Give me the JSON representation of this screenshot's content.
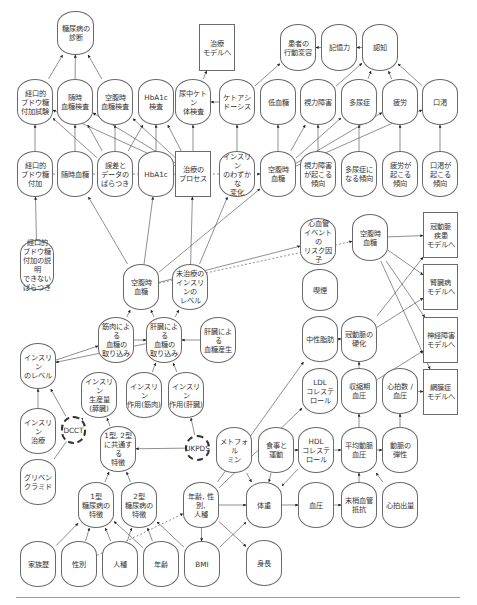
{
  "diagram": {
    "nodes": [
      {
        "id": "dm_diag",
        "label": "糖尿病の\n診断",
        "x": 57,
        "y": 11,
        "w": 37,
        "h": 44,
        "shape": "oval"
      },
      {
        "id": "to_treat_top",
        "label": "治療\nモデルへ",
        "x": 199,
        "y": 24,
        "w": 36,
        "h": 47,
        "shape": "box"
      },
      {
        "id": "behavior",
        "label": "患者の\n行動変容",
        "x": 280,
        "y": 24,
        "w": 36,
        "h": 47,
        "shape": "oval"
      },
      {
        "id": "memory",
        "label": "記憶力",
        "x": 321,
        "y": 24,
        "w": 36,
        "h": 47,
        "shape": "oval"
      },
      {
        "id": "cognition",
        "label": "認知",
        "x": 362,
        "y": 24,
        "w": 36,
        "h": 47,
        "shape": "oval"
      },
      {
        "id": "ogtt_test",
        "label": "経口的\nブドウ糖\n付加試験",
        "x": 17,
        "y": 79,
        "w": 36,
        "h": 46,
        "shape": "oval"
      },
      {
        "id": "rand_bg_test",
        "label": "随時\n血糖検査",
        "x": 57,
        "y": 79,
        "w": 36,
        "h": 46,
        "shape": "oval"
      },
      {
        "id": "fbg_test",
        "label": "空腹時\n血糖検査",
        "x": 97,
        "y": 79,
        "w": 36,
        "h": 46,
        "shape": "oval"
      },
      {
        "id": "hba1c_test",
        "label": "HbA1c\n検査",
        "x": 138,
        "y": 79,
        "w": 36,
        "h": 46,
        "shape": "oval"
      },
      {
        "id": "ketone_test",
        "label": "尿中ケトン\n体検査",
        "x": 175,
        "y": 79,
        "w": 36,
        "h": 46,
        "shape": "oval"
      },
      {
        "id": "ketoacidosis",
        "label": "ケトアシ\nドーシス",
        "x": 219,
        "y": 79,
        "w": 36,
        "h": 46,
        "shape": "oval"
      },
      {
        "id": "hypoglycemia",
        "label": "低血糖",
        "x": 260,
        "y": 79,
        "w": 36,
        "h": 46,
        "shape": "oval"
      },
      {
        "id": "vision",
        "label": "視力障害",
        "x": 300,
        "y": 79,
        "w": 36,
        "h": 46,
        "shape": "oval"
      },
      {
        "id": "polyuria",
        "label": "多尿症",
        "x": 341,
        "y": 79,
        "w": 36,
        "h": 46,
        "shape": "oval"
      },
      {
        "id": "fatigue",
        "label": "疲労",
        "x": 382,
        "y": 79,
        "w": 36,
        "h": 46,
        "shape": "oval"
      },
      {
        "id": "thirst",
        "label": "口渇",
        "x": 422,
        "y": 79,
        "w": 36,
        "h": 46,
        "shape": "oval"
      },
      {
        "id": "ogtt",
        "label": "経口的\nブドウ糖\n付加",
        "x": 17,
        "y": 151,
        "w": 36,
        "h": 46,
        "shape": "oval"
      },
      {
        "id": "rand_bg",
        "label": "随時血糖",
        "x": 57,
        "y": 151,
        "w": 36,
        "h": 46,
        "shape": "oval"
      },
      {
        "id": "error_var",
        "label": "誤差と\nデータの\nばらつき",
        "x": 97,
        "y": 151,
        "w": 36,
        "h": 46,
        "shape": "oval"
      },
      {
        "id": "hba1c",
        "label": "HbA1c",
        "x": 138,
        "y": 151,
        "w": 36,
        "h": 46,
        "shape": "oval"
      },
      {
        "id": "treat_process",
        "label": "治療の\nプロセス",
        "x": 175,
        "y": 151,
        "w": 36,
        "h": 46,
        "shape": "box"
      },
      {
        "id": "insulin_slight",
        "label": "インスリン\nのわずかな\n変化",
        "x": 219,
        "y": 151,
        "w": 36,
        "h": 46,
        "shape": "oval"
      },
      {
        "id": "fbg_mid",
        "label": "空腹時\n血糖",
        "x": 260,
        "y": 151,
        "w": 36,
        "h": 46,
        "shape": "oval"
      },
      {
        "id": "vision_tend",
        "label": "視力障害\nが起こる\n傾向",
        "x": 300,
        "y": 151,
        "w": 36,
        "h": 46,
        "shape": "oval"
      },
      {
        "id": "polyuria_tend",
        "label": "多尿症に\nなる傾向",
        "x": 341,
        "y": 151,
        "w": 36,
        "h": 46,
        "shape": "oval"
      },
      {
        "id": "fatigue_tend",
        "label": "疲労が\n起こる\n傾向",
        "x": 382,
        "y": 151,
        "w": 36,
        "h": 46,
        "shape": "oval"
      },
      {
        "id": "thirst_tend",
        "label": "口渇が\n起こる\n傾向",
        "x": 422,
        "y": 151,
        "w": 36,
        "h": 46,
        "shape": "oval"
      },
      {
        "id": "ogtt_unexpl",
        "label": "経口的\nブドウ糖\n付加の説明\nできない\nばらつき",
        "x": 20,
        "y": 240,
        "w": 34,
        "h": 50,
        "shape": "oval"
      },
      {
        "id": "cv_risk",
        "label": "心血管\nイベントの\nリスク因子",
        "x": 300,
        "y": 218,
        "w": 36,
        "h": 47,
        "shape": "oval"
      },
      {
        "id": "fbg_right",
        "label": "空腹時\n血糖",
        "x": 352,
        "y": 214,
        "w": 36,
        "h": 47,
        "shape": "oval"
      },
      {
        "id": "chd_model",
        "label": "冠動脈\n疾患\nモデルへ",
        "x": 423,
        "y": 212,
        "w": 35,
        "h": 46,
        "shape": "box"
      },
      {
        "id": "kidney_model",
        "label": "腎臓病\nモデルへ",
        "x": 423,
        "y": 264,
        "w": 35,
        "h": 46,
        "shape": "box"
      },
      {
        "id": "neuro_model",
        "label": "神経障害\nモデルへ",
        "x": 423,
        "y": 317,
        "w": 35,
        "h": 46,
        "shape": "box"
      },
      {
        "id": "retino_model",
        "label": "網膜症\nモデルへ",
        "x": 423,
        "y": 369,
        "w": 35,
        "h": 46,
        "shape": "box"
      },
      {
        "id": "fbg_lower",
        "label": "空腹時\n血糖",
        "x": 123,
        "y": 264,
        "w": 36,
        "h": 46,
        "shape": "oval"
      },
      {
        "id": "untreated_ins",
        "label": "未治療の\nインスリンの\nレベル",
        "x": 172,
        "y": 264,
        "w": 36,
        "h": 46,
        "shape": "oval"
      },
      {
        "id": "smoking",
        "label": "喫煙",
        "x": 302,
        "y": 269,
        "w": 36,
        "h": 42,
        "shape": "oval"
      },
      {
        "id": "muscle_uptake",
        "label": "筋肉による\n血糖の\n取り込み",
        "x": 98,
        "y": 317,
        "w": 36,
        "h": 46,
        "shape": "oval"
      },
      {
        "id": "liver_uptake",
        "label": "肝臓による\n血糖の\n取り込み",
        "x": 146,
        "y": 317,
        "w": 36,
        "h": 46,
        "shape": "oval"
      },
      {
        "id": "liver_prod",
        "label": "肝臓による\n血糖産生",
        "x": 200,
        "y": 317,
        "w": 36,
        "h": 46,
        "shape": "oval"
      },
      {
        "id": "triglyceride",
        "label": "中性脂肪",
        "x": 302,
        "y": 316,
        "w": 36,
        "h": 46,
        "shape": "oval"
      },
      {
        "id": "arterio",
        "label": "冠動脈の\n硬化",
        "x": 341,
        "y": 316,
        "w": 36,
        "h": 46,
        "shape": "oval"
      },
      {
        "id": "insulin_level",
        "label": "インスリン\nのレベル",
        "x": 20,
        "y": 343,
        "w": 36,
        "h": 46,
        "shape": "oval"
      },
      {
        "id": "ins_prod",
        "label": "インスリン\n生産量\n(膵臓)",
        "x": 81,
        "y": 372,
        "w": 36,
        "h": 46,
        "shape": "oval"
      },
      {
        "id": "ins_muscle",
        "label": "インスリン\n作用(筋肉)",
        "x": 126,
        "y": 372,
        "w": 36,
        "h": 46,
        "shape": "oval"
      },
      {
        "id": "ins_liver",
        "label": "インスリン\n作用(肝臓)",
        "x": 168,
        "y": 372,
        "w": 36,
        "h": 46,
        "shape": "oval"
      },
      {
        "id": "ldl",
        "label": "LDL\nコレステ\nロール",
        "x": 302,
        "y": 368,
        "w": 36,
        "h": 46,
        "shape": "oval"
      },
      {
        "id": "systolic",
        "label": "収縮期\n血圧",
        "x": 341,
        "y": 368,
        "w": 36,
        "h": 46,
        "shape": "oval"
      },
      {
        "id": "hr_bp",
        "label": "心拍数 /\n血圧",
        "x": 382,
        "y": 368,
        "w": 36,
        "h": 46,
        "shape": "oval"
      },
      {
        "id": "ins_treat",
        "label": "インスリン\n治療",
        "x": 20,
        "y": 408,
        "w": 36,
        "h": 46,
        "shape": "oval"
      },
      {
        "id": "dcct",
        "label": "DCCT",
        "x": 61,
        "y": 416,
        "w": 25,
        "h": 28,
        "shape": "dashed"
      },
      {
        "id": "common_feat",
        "label": "1型, 2型\nに共通する\n特徴",
        "x": 100,
        "y": 426,
        "w": 36,
        "h": 46,
        "shape": "oval"
      },
      {
        "id": "ukpds",
        "label": "UKPDS",
        "x": 185,
        "y": 435,
        "w": 25,
        "h": 26,
        "shape": "dashed"
      },
      {
        "id": "metformin",
        "label": "メトフォル\nミン",
        "x": 216,
        "y": 427,
        "w": 36,
        "h": 46,
        "shape": "oval"
      },
      {
        "id": "diet_ex",
        "label": "食事と\n運動",
        "x": 258,
        "y": 427,
        "w": 36,
        "h": 46,
        "shape": "oval"
      },
      {
        "id": "hdl",
        "label": "HDL\nコレステ\nロール",
        "x": 298,
        "y": 427,
        "w": 36,
        "h": 46,
        "shape": "oval"
      },
      {
        "id": "map",
        "label": "平均動脈\n血圧",
        "x": 341,
        "y": 427,
        "w": 36,
        "h": 46,
        "shape": "oval"
      },
      {
        "id": "elasticity",
        "label": "動脈の\n弾性",
        "x": 382,
        "y": 427,
        "w": 36,
        "h": 46,
        "shape": "oval"
      },
      {
        "id": "glibenclamide",
        "label": "グリベン\nクラミド",
        "x": 20,
        "y": 459,
        "w": 36,
        "h": 46,
        "shape": "oval"
      },
      {
        "id": "t1_feat",
        "label": "1型\n糖尿病の\n特徴",
        "x": 78,
        "y": 482,
        "w": 36,
        "h": 46,
        "shape": "oval"
      },
      {
        "id": "t2_feat",
        "label": "2型\n糖尿病の\n特徴",
        "x": 121,
        "y": 482,
        "w": 36,
        "h": 46,
        "shape": "oval"
      },
      {
        "id": "age_sex_race",
        "label": "年齢, 性別,\n人種",
        "x": 183,
        "y": 482,
        "w": 36,
        "h": 46,
        "shape": "oval"
      },
      {
        "id": "weight",
        "label": "体重",
        "x": 246,
        "y": 482,
        "w": 36,
        "h": 46,
        "shape": "oval"
      },
      {
        "id": "bp",
        "label": "血圧",
        "x": 298,
        "y": 482,
        "w": 36,
        "h": 46,
        "shape": "oval"
      },
      {
        "id": "peripheral",
        "label": "末梢血管\n抵抗",
        "x": 341,
        "y": 482,
        "w": 36,
        "h": 46,
        "shape": "oval"
      },
      {
        "id": "cardiac_out",
        "label": "心拍出量",
        "x": 382,
        "y": 482,
        "w": 36,
        "h": 46,
        "shape": "oval"
      },
      {
        "id": "family",
        "label": "家族歴",
        "x": 20,
        "y": 541,
        "w": 36,
        "h": 46,
        "shape": "oval"
      },
      {
        "id": "sex",
        "label": "性別",
        "x": 61,
        "y": 541,
        "w": 36,
        "h": 46,
        "shape": "oval"
      },
      {
        "id": "race",
        "label": "人種",
        "x": 102,
        "y": 541,
        "w": 36,
        "h": 46,
        "shape": "oval"
      },
      {
        "id": "age",
        "label": "年齢",
        "x": 143,
        "y": 541,
        "w": 36,
        "h": 46,
        "shape": "oval"
      },
      {
        "id": "bmi",
        "label": "BMI",
        "x": 184,
        "y": 541,
        "w": 36,
        "h": 46,
        "shape": "oval"
      },
      {
        "id": "height",
        "label": "身長",
        "x": 246,
        "y": 540,
        "w": 36,
        "h": 46,
        "shape": "oval"
      }
    ],
    "edges": [
      [
        "ogtt_test",
        "dm_diag"
      ],
      [
        "rand_bg_test",
        "dm_diag"
      ],
      [
        "fbg_test",
        "dm_diag"
      ],
      [
        "ketone_test",
        "to_treat_top"
      ],
      [
        "ketoacidosis",
        "ketone_test"
      ],
      [
        "ketoacidosis",
        "behavior"
      ],
      [
        "memory",
        "behavior"
      ],
      [
        "cognition",
        "memory"
      ],
      [
        "vision",
        "cognition"
      ],
      [
        "polyuria",
        "cognition"
      ],
      [
        "fatigue",
        "cognition"
      ],
      [
        "thirst",
        "cognition"
      ],
      [
        "ogtt",
        "ogtt_test"
      ],
      [
        "rand_bg",
        "rand_bg_test"
      ],
      [
        "error_var",
        "ogtt_test"
      ],
      [
        "error_var",
        "rand_bg_test"
      ],
      [
        "error_var",
        "fbg_test"
      ],
      [
        "error_var",
        "hba1c_test"
      ],
      [
        "hba1c",
        "hba1c_test"
      ],
      [
        "treat_process",
        "ketone_test"
      ],
      [
        "treat_process",
        "ogtt_test"
      ],
      [
        "treat_process",
        "rand_bg_test"
      ],
      [
        "treat_process",
        "fbg_test"
      ],
      [
        "treat_process",
        "hba1c_test"
      ],
      [
        "insulin_slight",
        "ketoacidosis"
      ],
      [
        "fbg_mid",
        "hypoglycemia"
      ],
      [
        "vision_tend",
        "vision"
      ],
      [
        "polyuria_tend",
        "polyuria"
      ],
      [
        "fatigue_tend",
        "fatigue"
      ],
      [
        "thirst_tend",
        "thirst"
      ],
      [
        "fbg_mid",
        "vision"
      ],
      [
        "fbg_mid",
        "polyuria"
      ],
      [
        "fbg_mid",
        "fatigue"
      ],
      [
        "fbg_mid",
        "thirst"
      ],
      [
        "ogtt_unexpl",
        "ogtt"
      ],
      [
        "fbg_lower",
        "rand_bg"
      ],
      [
        "fbg_lower",
        "hba1c"
      ],
      [
        "fbg_lower",
        "fbg_mid"
      ],
      [
        "untreated_ins",
        "insulin_slight"
      ],
      [
        "untreated_ins",
        "treat_process"
      ],
      [
        "fbg_lower",
        "cv_risk"
      ],
      [
        "fbg_right",
        "chd_model"
      ],
      [
        "fbg_right",
        "kidney_model"
      ],
      [
        "fbg_right",
        "neuro_model"
      ],
      [
        "fbg_right",
        "retino_model"
      ],
      [
        "arterio",
        "chd_model"
      ],
      [
        "arterio",
        "kidney_model"
      ],
      [
        "systolic",
        "neuro_model"
      ],
      [
        "hr_bp",
        "retino_model"
      ],
      [
        "muscle_uptake",
        "fbg_lower"
      ],
      [
        "liver_uptake",
        "fbg_lower"
      ],
      [
        "liver_uptake",
        "untreated_ins"
      ],
      [
        "liver_prod",
        "liver_uptake"
      ],
      [
        "liver_uptake",
        "insulin_level"
      ],
      [
        "muscle_uptake",
        "liver_uptake"
      ],
      [
        "insulin_level",
        "muscle_uptake"
      ],
      [
        "ins_muscle",
        "liver_uptake"
      ],
      [
        "ins_liver",
        "liver_uptake"
      ],
      [
        "triglyceride",
        "arterio"
      ],
      [
        "systolic",
        "arterio"
      ],
      [
        "ins_treat",
        "insulin_level"
      ],
      [
        "dcct",
        "insulin_level"
      ],
      [
        "common_feat",
        "ins_prod"
      ],
      [
        "ukpds",
        "ins_liver"
      ],
      [
        "ukpds",
        "common_feat"
      ],
      [
        "glibenclamide",
        "ins_prod"
      ],
      [
        "t1_feat",
        "common_feat"
      ],
      [
        "t2_feat",
        "common_feat"
      ],
      [
        "hdl",
        "map"
      ],
      [
        "diet_ex",
        "hdl"
      ],
      [
        "map",
        "elasticity"
      ],
      [
        "peripheral",
        "map"
      ],
      [
        "cardiac_out",
        "map"
      ],
      [
        "bp",
        "peripheral"
      ],
      [
        "weight",
        "bp"
      ],
      [
        "age_sex_race",
        "weight"
      ],
      [
        "age_sex_race",
        "height"
      ],
      [
        "metformin",
        "weight"
      ],
      [
        "diet_ex",
        "weight"
      ],
      [
        "hdl",
        "weight"
      ],
      [
        "family",
        "t1_feat"
      ],
      [
        "sex",
        "t1_feat"
      ],
      [
        "race",
        "t1_feat"
      ],
      [
        "age",
        "t2_feat"
      ],
      [
        "bmi",
        "t2_feat"
      ],
      [
        "race",
        "t2_feat"
      ],
      [
        "age",
        "t1_feat"
      ],
      [
        "bmi",
        "weight"
      ],
      [
        "age_sex_race",
        "bmi"
      ],
      [
        "age_sex_race",
        "ldl"
      ],
      [
        "age_sex_race",
        "triglyceride"
      ],
      [
        "map",
        "systolic"
      ],
      [
        "elasticity",
        "hr_bp"
      ]
    ],
    "dashed_edges": [
      [
        "fbg_lower",
        "fbg_right"
      ],
      [
        "ogtt",
        "fbg_mid"
      ],
      [
        "sex",
        "age_sex_race"
      ]
    ]
  }
}
